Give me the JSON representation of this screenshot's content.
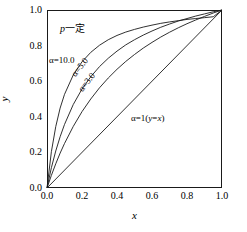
{
  "chart_data": {
    "type": "line",
    "title": "",
    "xlabel": "x",
    "ylabel": "y",
    "xlim": [
      0.0,
      1.0
    ],
    "ylim": [
      0.0,
      1.0
    ],
    "grid": false,
    "legend_position": "inline-curve-labels",
    "xticks": [
      "0.0",
      "0.2",
      "0.4",
      "0.6",
      "0.8",
      "1.0"
    ],
    "yticks": [
      "0.0",
      "0.2",
      "0.4",
      "0.6",
      "0.8",
      "1.0"
    ],
    "xtick_values": [
      0.0,
      0.2,
      0.4,
      0.6,
      0.8,
      1.0
    ],
    "ytick_values": [
      0.0,
      0.2,
      0.4,
      0.6,
      0.8,
      1.0
    ],
    "formula": "y = a*x / (1 + (a-1)*x)",
    "annotations": [
      {
        "name": "p-constant",
        "text_prefix": "p",
        "text_suffix": "一定"
      },
      {
        "name": "alpha-10",
        "text": "α=10.0"
      },
      {
        "name": "alpha-5",
        "text": "α=5.0"
      },
      {
        "name": "alpha-3",
        "text": "α=3.0"
      },
      {
        "name": "alpha-1",
        "text_prefix": "α=1(",
        "text_ital1": "y",
        "text_mid": "=",
        "text_ital2": "x",
        "text_suffix": ")"
      }
    ],
    "series": [
      {
        "name": "α=10.0",
        "alpha": 10.0,
        "color": "#1a1a1a",
        "x": [
          0.0,
          0.025,
          0.05,
          0.075,
          0.1,
          0.15,
          0.2,
          0.25,
          0.3,
          0.35,
          0.4,
          0.45,
          0.5,
          0.55,
          0.6,
          0.65,
          0.7,
          0.75,
          0.8,
          0.85,
          0.9,
          0.95,
          1.0
        ],
        "y": [
          0.0,
          0.204,
          0.345,
          0.449,
          0.526,
          0.635,
          0.709,
          0.762,
          0.802,
          0.833,
          0.857,
          0.876,
          0.891,
          0.904,
          0.915,
          0.925,
          0.933,
          0.94,
          0.947,
          0.952,
          0.957,
          0.962,
          1.0
        ]
      },
      {
        "name": "α=5.0",
        "alpha": 5.0,
        "color": "#1a1a1a",
        "x": [
          0.0,
          0.025,
          0.05,
          0.075,
          0.1,
          0.15,
          0.2,
          0.25,
          0.3,
          0.35,
          0.4,
          0.45,
          0.5,
          0.55,
          0.6,
          0.65,
          0.7,
          0.75,
          0.8,
          0.85,
          0.9,
          0.95,
          1.0
        ],
        "y": [
          0.0,
          0.114,
          0.208,
          0.288,
          0.357,
          0.469,
          0.556,
          0.625,
          0.682,
          0.729,
          0.769,
          0.804,
          0.833,
          0.859,
          0.882,
          0.903,
          0.921,
          0.938,
          0.952,
          0.966,
          0.978,
          0.99,
          1.0
        ]
      },
      {
        "name": "α=3.0",
        "alpha": 3.0,
        "color": "#1a1a1a",
        "x": [
          0.0,
          0.025,
          0.05,
          0.075,
          0.1,
          0.15,
          0.2,
          0.25,
          0.3,
          0.35,
          0.4,
          0.45,
          0.5,
          0.55,
          0.6,
          0.65,
          0.7,
          0.75,
          0.8,
          0.85,
          0.9,
          0.95,
          1.0
        ],
        "y": [
          0.0,
          0.071,
          0.136,
          0.196,
          0.25,
          0.346,
          0.429,
          0.5,
          0.563,
          0.618,
          0.667,
          0.711,
          0.75,
          0.786,
          0.818,
          0.848,
          0.875,
          0.9,
          0.923,
          0.944,
          0.964,
          0.983,
          1.0
        ]
      },
      {
        "name": "α=1",
        "alpha": 1.0,
        "color": "#1a1a1a",
        "x": [
          0.0,
          1.0
        ],
        "y": [
          0.0,
          1.0
        ]
      }
    ]
  }
}
